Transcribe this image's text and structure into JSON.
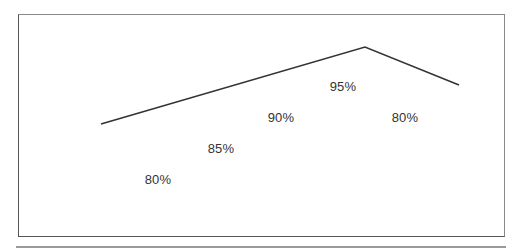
{
  "chart_data": {
    "type": "line",
    "title": "",
    "xlabel": "",
    "ylabel": "",
    "grid": false,
    "legend": null,
    "line_points_px": [
      [
        101,
        124
      ],
      [
        365,
        47
      ],
      [
        459,
        85
      ]
    ],
    "line_color": "#333333",
    "data_labels": [
      {
        "text": "80%",
        "value": 80,
        "x": 158,
        "y": 179
      },
      {
        "text": "85%",
        "value": 85,
        "x": 221,
        "y": 148
      },
      {
        "text": "90%",
        "value": 90,
        "x": 281,
        "y": 117
      },
      {
        "text": "95%",
        "value": 95,
        "x": 343,
        "y": 86
      },
      {
        "text": "80%",
        "value": 80,
        "x": 405,
        "y": 117
      }
    ],
    "categories": [
      "1",
      "2",
      "3",
      "4",
      "5"
    ],
    "values": [
      80,
      85,
      90,
      95,
      80
    ]
  }
}
